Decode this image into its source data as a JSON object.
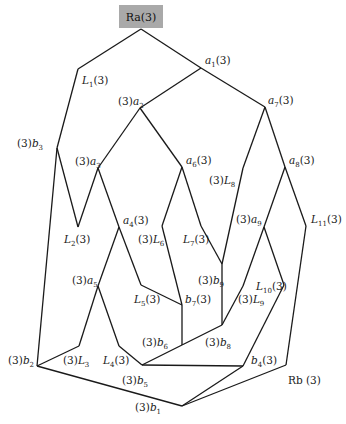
{
  "diagram": {
    "root": {
      "id": "Ra",
      "label": "Ra(3)",
      "box_color": "#a9a9a9",
      "x": 141,
      "y": 17
    },
    "sink": {
      "id": "Rb",
      "label": "Rb (3)"
    },
    "nodes": [
      {
        "id": "Ra",
        "x": 141,
        "y": 29
      },
      {
        "id": "L1",
        "x": 78,
        "y": 69
      },
      {
        "id": "a1",
        "x": 201,
        "y": 68
      },
      {
        "id": "a2",
        "x": 140,
        "y": 108
      },
      {
        "id": "a7",
        "x": 265,
        "y": 107
      },
      {
        "id": "b3",
        "x": 57,
        "y": 148
      },
      {
        "id": "a3",
        "x": 98,
        "y": 168
      },
      {
        "id": "a6",
        "x": 182,
        "y": 167
      },
      {
        "id": "L8",
        "x": 243,
        "y": 168
      },
      {
        "id": "a8",
        "x": 285,
        "y": 167
      },
      {
        "id": "L2",
        "x": 78,
        "y": 227
      },
      {
        "id": "a4",
        "x": 119,
        "y": 227
      },
      {
        "id": "L6",
        "x": 162,
        "y": 226
      },
      {
        "id": "L7",
        "x": 201,
        "y": 226
      },
      {
        "id": "a9",
        "x": 264,
        "y": 227
      },
      {
        "id": "L11",
        "x": 306,
        "y": 226
      },
      {
        "id": "b9",
        "x": 222,
        "y": 264
      },
      {
        "id": "a5",
        "x": 98,
        "y": 286
      },
      {
        "id": "L5",
        "x": 141,
        "y": 285
      },
      {
        "id": "L10",
        "x": 284,
        "y": 285
      },
      {
        "id": "L9",
        "x": 243,
        "y": 286
      },
      {
        "id": "b7",
        "x": 182,
        "y": 305
      },
      {
        "id": "b8",
        "x": 222,
        "y": 325
      },
      {
        "id": "b6",
        "x": 182,
        "y": 345
      },
      {
        "id": "L3",
        "x": 79,
        "y": 346
      },
      {
        "id": "L4",
        "x": 119,
        "y": 346
      },
      {
        "id": "L4b",
        "x": 142,
        "y": 365
      },
      {
        "id": "b2",
        "x": 37,
        "y": 366
      },
      {
        "id": "b4",
        "x": 243,
        "y": 366
      },
      {
        "id": "Rb",
        "x": 286,
        "y": 365
      },
      {
        "id": "b1",
        "x": 182,
        "y": 406
      }
    ],
    "edges": [
      [
        "Ra",
        "L1"
      ],
      [
        "L1",
        "b3"
      ],
      [
        "Ra",
        "a1"
      ],
      [
        "a1",
        "a2"
      ],
      [
        "a1",
        "a7"
      ],
      [
        "a2",
        "a3"
      ],
      [
        "a2",
        "a6"
      ],
      [
        "b3",
        "L2"
      ],
      [
        "L2",
        "a3"
      ],
      [
        "b3",
        "b2"
      ],
      [
        "a3",
        "a4"
      ],
      [
        "a4",
        "a5"
      ],
      [
        "a4",
        "L5"
      ],
      [
        "L5",
        "b7"
      ],
      [
        "a6",
        "L6"
      ],
      [
        "L6",
        "b7"
      ],
      [
        "a6",
        "L7"
      ],
      [
        "L7",
        "b9"
      ],
      [
        "a7",
        "L8"
      ],
      [
        "L8",
        "b9"
      ],
      [
        "a7",
        "a8"
      ],
      [
        "a8",
        "a9"
      ],
      [
        "a8",
        "L11"
      ],
      [
        "L11",
        "Rb"
      ],
      [
        "a9",
        "L9"
      ],
      [
        "L9",
        "b8"
      ],
      [
        "a9",
        "L10"
      ],
      [
        "L10",
        "b4"
      ],
      [
        "b9",
        "b8"
      ],
      [
        "b7",
        "b6"
      ],
      [
        "b8",
        "b6"
      ],
      [
        "b6",
        "L4b"
      ],
      [
        "a5",
        "L3"
      ],
      [
        "L3",
        "b2"
      ],
      [
        "a5",
        "L4"
      ],
      [
        "L4",
        "L4b"
      ],
      [
        "L4b",
        "b4"
      ],
      [
        "b2",
        "b1"
      ],
      [
        "b4",
        "b1"
      ],
      [
        "Rb",
        "b1"
      ]
    ],
    "labels": [
      {
        "id": "a1",
        "pre": "",
        "base": "a",
        "sub": "1",
        "post": "(3)",
        "x": 205,
        "y": 64
      },
      {
        "id": "L1",
        "pre": "",
        "base": "L",
        "sub": "1",
        "post": "(3)",
        "x": 82,
        "y": 84
      },
      {
        "id": "a2",
        "pre": "(3)",
        "base": "a",
        "sub": "2",
        "post": "",
        "x": 118,
        "y": 105
      },
      {
        "id": "a7",
        "pre": "",
        "base": "a",
        "sub": "7",
        "post": "(3)",
        "x": 268,
        "y": 104
      },
      {
        "id": "b3",
        "pre": "(3)",
        "base": "b",
        "sub": "3",
        "post": "",
        "x": 17,
        "y": 147
      },
      {
        "id": "a3",
        "pre": "(3)",
        "base": "a",
        "sub": "3",
        "post": "",
        "x": 75,
        "y": 165
      },
      {
        "id": "a6",
        "pre": "",
        "base": "a",
        "sub": "6",
        "post": "(3)",
        "x": 186,
        "y": 164
      },
      {
        "id": "a8",
        "pre": "",
        "base": "a",
        "sub": "8",
        "post": "(3)",
        "x": 289,
        "y": 164
      },
      {
        "id": "L8",
        "pre": "(3)",
        "base": "L",
        "sub": "8",
        "post": "",
        "x": 209,
        "y": 184
      },
      {
        "id": "L2",
        "pre": "",
        "base": "L",
        "sub": "2",
        "post": "(3)",
        "x": 64,
        "y": 243
      },
      {
        "id": "a4",
        "pre": "",
        "base": "a",
        "sub": "4",
        "post": "(3)",
        "x": 123,
        "y": 224
      },
      {
        "id": "L6",
        "pre": "(3)",
        "base": "L",
        "sub": "6",
        "post": "",
        "x": 138,
        "y": 243
      },
      {
        "id": "L7",
        "pre": "",
        "base": "L",
        "sub": "7",
        "post": "(3)",
        "x": 183,
        "y": 243
      },
      {
        "id": "a9",
        "pre": "(3)",
        "base": "a",
        "sub": "9",
        "post": "",
        "x": 236,
        "y": 223
      },
      {
        "id": "L11",
        "pre": "",
        "base": "L",
        "sub": "11",
        "post": "(3)",
        "x": 311,
        "y": 223
      },
      {
        "id": "a5",
        "pre": "(3)",
        "base": "a",
        "sub": "5",
        "post": "",
        "x": 72,
        "y": 284
      },
      {
        "id": "b9",
        "pre": "(3)",
        "base": "b",
        "sub": "9",
        "post": "",
        "x": 198,
        "y": 284
      },
      {
        "id": "L10",
        "pre": "",
        "base": "L",
        "sub": "10",
        "post": "(3)",
        "x": 256,
        "y": 290
      },
      {
        "id": "L5",
        "pre": "",
        "base": "L",
        "sub": "5",
        "post": "(3)",
        "x": 134,
        "y": 303
      },
      {
        "id": "b7",
        "pre": "",
        "base": "b",
        "sub": "7",
        "post": "(3)",
        "x": 185,
        "y": 303
      },
      {
        "id": "L9",
        "pre": "(3)",
        "base": "L",
        "sub": "9",
        "post": "",
        "x": 238,
        "y": 303
      },
      {
        "id": "b6",
        "pre": "(3)",
        "base": "b",
        "sub": "6",
        "post": "",
        "x": 142,
        "y": 346
      },
      {
        "id": "b8",
        "pre": "(3)",
        "base": "b",
        "sub": "8",
        "post": "",
        "x": 205,
        "y": 346
      },
      {
        "id": "b2",
        "pre": "(3)",
        "base": "b",
        "sub": "2",
        "post": "",
        "x": 8,
        "y": 364
      },
      {
        "id": "L3",
        "pre": "(3)",
        "base": "L",
        "sub": "3",
        "post": "",
        "x": 63,
        "y": 364
      },
      {
        "id": "L4",
        "pre": "",
        "base": "L",
        "sub": "4",
        "post": "(3)",
        "x": 103,
        "y": 364
      },
      {
        "id": "b4",
        "pre": "",
        "base": "b",
        "sub": "4",
        "post": "(3)",
        "x": 251,
        "y": 364
      },
      {
        "id": "b5",
        "pre": "(3)",
        "base": "b",
        "sub": "5",
        "post": "",
        "x": 122,
        "y": 384
      },
      {
        "id": "b1",
        "pre": "(3)",
        "base": "b",
        "sub": "1",
        "post": "",
        "x": 135,
        "y": 411
      },
      {
        "id": "Rb",
        "pre": "",
        "base": "Rb (3)",
        "sub": "",
        "post": "",
        "x": 288,
        "y": 384,
        "plain": true
      }
    ]
  }
}
